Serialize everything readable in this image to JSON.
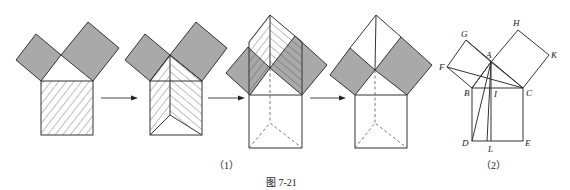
{
  "figure": {
    "caption": "图 7-21",
    "subfigure_1_caption": "（1）",
    "subfigure_2_caption": "（2）",
    "shade_color": "#a9a9a9",
    "line_color": "#333333",
    "subfigure_2_labels": {
      "A": "A",
      "B": "B",
      "C": "C",
      "D": "D",
      "E": "E",
      "F": "F",
      "G": "G",
      "H": "H",
      "I": "I",
      "K": "K",
      "L": "L"
    },
    "steps": [
      {
        "name": "step-1",
        "description": "Right triangle with two shaded leg squares and a hatched hypotenuse square"
      },
      {
        "name": "step-2",
        "description": "Hypotenuse square split into two hatched parallelograms"
      },
      {
        "name": "step-3",
        "description": "Parallelograms sheared up onto the leg squares"
      },
      {
        "name": "step-4",
        "description": "Leg squares shown equal to the relocated parallelograms"
      }
    ]
  }
}
